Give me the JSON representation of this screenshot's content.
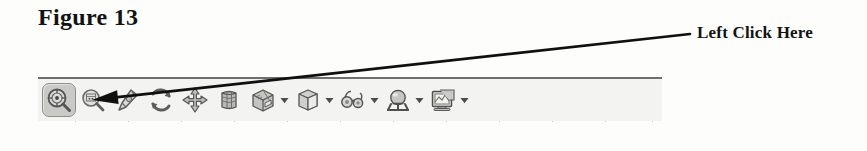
{
  "figure": {
    "caption": "Figure 13"
  },
  "annotation": {
    "label": "Left Click Here",
    "arrow_from_x": 690,
    "arrow_from_y": 34,
    "arrow_to_x": 92,
    "arrow_to_y": 100
  },
  "toolbar": {
    "name": "3d-view-toolbar",
    "background_color": "#f3f3f1",
    "border_color": "#6f6f6f",
    "highlight_color": "#c9c9c6",
    "items": [
      {
        "name": "zoom-realtime-button",
        "icon": "magnifier-target-icon",
        "label": "Zoom Realtime",
        "pressed": true,
        "has_dropdown": false
      },
      {
        "name": "zoom-window-button",
        "icon": "magnifier-window-icon",
        "label": "Zoom Window",
        "pressed": false,
        "has_dropdown": false
      },
      {
        "name": "pan-hand-button",
        "icon": "pen-pointer-icon",
        "label": "Pan",
        "pressed": false,
        "has_dropdown": false
      },
      {
        "name": "orbit-refresh-button",
        "icon": "refresh-arrows-icon",
        "label": "Refresh View",
        "pressed": false,
        "has_dropdown": false
      },
      {
        "name": "move-button",
        "icon": "four-way-arrows-icon",
        "label": "Move",
        "pressed": false,
        "has_dropdown": false
      },
      {
        "name": "cylinder-button",
        "icon": "cylinder-mesh-icon",
        "label": "Cylinder",
        "pressed": false,
        "has_dropdown": false
      },
      {
        "name": "clipped-box-button",
        "icon": "clipped-box-icon",
        "label": "Clipped Box",
        "pressed": false,
        "has_dropdown": true
      },
      {
        "name": "box-button",
        "icon": "shaded-cube-icon",
        "label": "Box",
        "pressed": false,
        "has_dropdown": true
      },
      {
        "name": "glasses-button",
        "icon": "glasses-icon",
        "label": "Viewpoint",
        "pressed": false,
        "has_dropdown": true
      },
      {
        "name": "light-sphere-button",
        "icon": "sphere-light-icon",
        "label": "Lighting",
        "pressed": false,
        "has_dropdown": true
      },
      {
        "name": "render-display-button",
        "icon": "monitor-render-icon",
        "label": "Render Display",
        "pressed": false,
        "has_dropdown": true
      }
    ]
  }
}
